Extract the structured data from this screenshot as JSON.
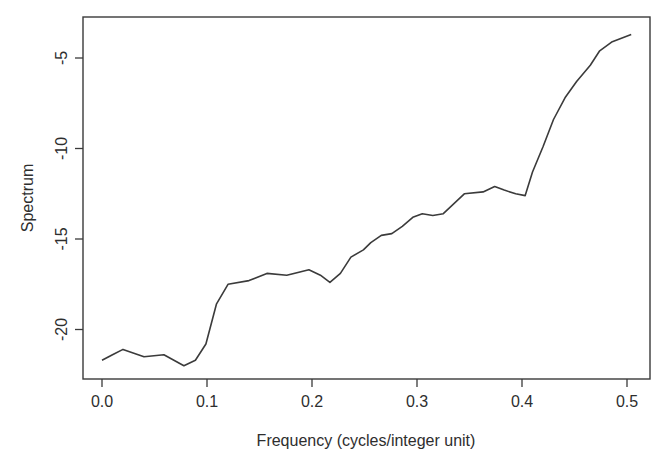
{
  "chart_data": {
    "type": "line",
    "title": "",
    "xlabel": "Frequency (cycles/integer unit)",
    "ylabel": "Spectrum",
    "xlim": [
      -0.017,
      0.52
    ],
    "ylim": [
      -22.5,
      -3.3
    ],
    "xticks": [
      0.0,
      0.1,
      0.2,
      0.3,
      0.4,
      0.5
    ],
    "xtick_labels": [
      "0.0",
      "0.1",
      "0.2",
      "0.3",
      "0.4",
      "0.5"
    ],
    "yticks": [
      -5,
      -10,
      -15,
      -20
    ],
    "ytick_labels": [
      "-5",
      "-10",
      "-15",
      "-20"
    ],
    "grid": false,
    "legend": null,
    "series": [
      {
        "name": "Spectrum",
        "color": "#3b3b3b",
        "x": [
          0.0,
          0.01,
          0.02,
          0.04,
          0.059,
          0.078,
          0.089,
          0.099,
          0.109,
          0.12,
          0.14,
          0.157,
          0.176,
          0.197,
          0.208,
          0.217,
          0.227,
          0.237,
          0.249,
          0.256,
          0.266,
          0.276,
          0.286,
          0.296,
          0.305,
          0.315,
          0.325,
          0.345,
          0.363,
          0.374,
          0.383,
          0.394,
          0.403,
          0.41,
          0.42,
          0.43,
          0.441,
          0.452,
          0.465,
          0.474,
          0.486,
          0.504
        ],
        "y": [
          -21.7,
          -21.4,
          -21.1,
          -21.5,
          -21.4,
          -22.0,
          -21.7,
          -20.8,
          -18.6,
          -17.5,
          -17.3,
          -16.9,
          -17.0,
          -16.7,
          -17.0,
          -17.4,
          -16.9,
          -16.0,
          -15.6,
          -15.2,
          -14.8,
          -14.7,
          -14.3,
          -13.8,
          -13.6,
          -13.7,
          -13.6,
          -12.5,
          -12.4,
          -12.1,
          -12.3,
          -12.5,
          -12.6,
          -11.3,
          -9.9,
          -8.4,
          -7.2,
          -6.3,
          -5.4,
          -4.6,
          -4.1,
          -3.7
        ]
      }
    ]
  }
}
